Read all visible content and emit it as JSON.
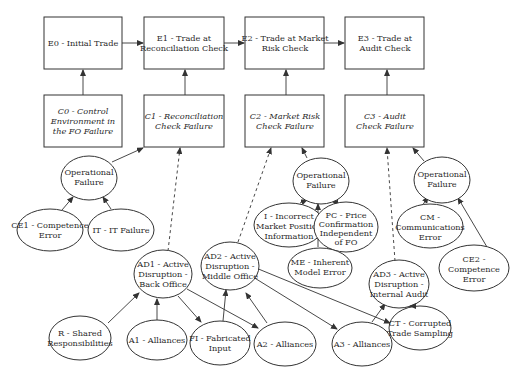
{
  "events": [
    {
      "id": "E0",
      "lines": [
        "E0 - Initial Trade"
      ]
    },
    {
      "id": "E1",
      "lines": [
        "E1 - Trade at",
        "Reconciliation Check"
      ]
    },
    {
      "id": "E2",
      "lines": [
        "E2 - Trade at Market",
        "Risk Check"
      ]
    },
    {
      "id": "E3",
      "lines": [
        "E3 - Trade at",
        "Audit Check"
      ]
    }
  ],
  "conditions": [
    {
      "id": "C0",
      "lines": [
        "C0 - Control",
        "Environment in",
        "the FO Failure"
      ]
    },
    {
      "id": "C1",
      "lines": [
        "C1 - Reconciliation",
        "Check Failure"
      ]
    },
    {
      "id": "C2",
      "lines": [
        "C2 - Market Risk",
        "Check Failure"
      ]
    },
    {
      "id": "C3",
      "lines": [
        "C3 - Audit",
        "Check Failure"
      ]
    }
  ],
  "operational_failures": [
    {
      "id": "OF1",
      "lines": [
        "Operational",
        "Failure"
      ]
    },
    {
      "id": "OF2",
      "lines": [
        "Operational",
        "Failure"
      ]
    },
    {
      "id": "OF3",
      "lines": [
        "Operational",
        "Failure"
      ]
    }
  ],
  "causes": {
    "CE1": [
      "CE1 - Competence",
      "Error"
    ],
    "IT": [
      "IT - IT Failure"
    ],
    "I": [
      "I - Incorrect",
      "Market Position",
      "Information"
    ],
    "PC": [
      "PC - Price",
      "Confirmation",
      "Independent",
      "of FO"
    ],
    "ME": [
      "ME - Inherent",
      "Model Error"
    ],
    "CM": [
      "CM -",
      "Communications",
      "Error"
    ],
    "CE2": [
      "CE2 -",
      "Competence",
      "Error"
    ]
  },
  "disruptions": {
    "AD1": [
      "AD1 - Active",
      "Disruption -",
      "Back Office"
    ],
    "AD2": [
      "AD2 - Active",
      "Disruption -",
      "Middle Office"
    ],
    "AD3": [
      "AD3 - Active",
      "Disruption -",
      "Internal Audit"
    ]
  },
  "inputs": {
    "R": [
      "R - Shared",
      "Responsibilities"
    ],
    "A1": [
      "A1 - Alliances"
    ],
    "FI": [
      "FI - Fabricated",
      "Input"
    ],
    "A2": [
      "A2 - Alliances"
    ],
    "A3": [
      "A3 - Alliances"
    ],
    "CT": [
      "CT - Corrupted",
      "Trade Sampling"
    ]
  }
}
